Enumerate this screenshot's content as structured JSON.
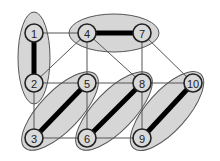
{
  "diagram": {
    "type": "graph-matching",
    "colors": {
      "background": "#ffffff",
      "cluster_fill": "#d6d6d6",
      "cluster_stroke": "#555555",
      "node_fill": "#d9d9d9",
      "node_stroke": "#222222",
      "edge": "#555555",
      "matched_edge": "#000000"
    },
    "nodes": [
      {
        "id": "1",
        "label": "1",
        "x": 34,
        "y": 33
      },
      {
        "id": "2",
        "label": "2",
        "x": 34,
        "y": 83
      },
      {
        "id": "3",
        "label": "3",
        "x": 34,
        "y": 138
      },
      {
        "id": "4",
        "label": "4",
        "x": 87,
        "y": 33
      },
      {
        "id": "5",
        "label": "5",
        "x": 87,
        "y": 83
      },
      {
        "id": "6",
        "label": "6",
        "x": 87,
        "y": 138
      },
      {
        "id": "7",
        "label": "7",
        "x": 142,
        "y": 33
      },
      {
        "id": "8",
        "label": "8",
        "x": 142,
        "y": 83
      },
      {
        "id": "9",
        "label": "9",
        "x": 142,
        "y": 138
      },
      {
        "id": "10",
        "label": "10",
        "x": 193,
        "y": 83
      }
    ],
    "matched_edges": [
      [
        "1",
        "2"
      ],
      [
        "4",
        "7"
      ],
      [
        "3",
        "5"
      ],
      [
        "6",
        "8"
      ],
      [
        "9",
        "10"
      ]
    ],
    "edges": [
      [
        "1",
        "4"
      ],
      [
        "2",
        "4"
      ],
      [
        "4",
        "5"
      ],
      [
        "4",
        "8"
      ],
      [
        "7",
        "8"
      ],
      [
        "7",
        "10"
      ],
      [
        "2",
        "5"
      ],
      [
        "5",
        "8"
      ],
      [
        "8",
        "10"
      ],
      [
        "2",
        "3"
      ],
      [
        "3",
        "6"
      ],
      [
        "6",
        "9"
      ],
      [
        "5",
        "6"
      ],
      [
        "8",
        "9"
      ]
    ],
    "clusters": [
      {
        "name": "cluster-1-2",
        "cx": 34,
        "cy": 58,
        "rx": 16,
        "ry": 46,
        "rotate": 0
      },
      {
        "name": "cluster-4-7",
        "cx": 114,
        "cy": 33,
        "rx": 45,
        "ry": 19,
        "rotate": 0
      },
      {
        "name": "cluster-3-5",
        "cx": 60,
        "cy": 111,
        "rx": 51,
        "ry": 20,
        "rotate": -46
      },
      {
        "name": "cluster-6-8",
        "cx": 114,
        "cy": 111,
        "rx": 51,
        "ry": 20,
        "rotate": -46
      },
      {
        "name": "cluster-9-10",
        "cx": 167,
        "cy": 111,
        "rx": 50,
        "ry": 20,
        "rotate": -48
      }
    ]
  }
}
